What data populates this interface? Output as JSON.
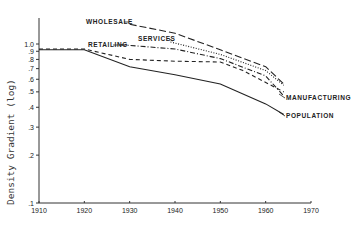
{
  "chart_data": {
    "type": "line",
    "title": "",
    "xlabel": "",
    "ylabel": "Density Gradient (log)",
    "yscale": "log",
    "xlim": [
      1910,
      1970
    ],
    "ylim": [
      0.1,
      1.0
    ],
    "grid": false,
    "legend_position": "inline labels",
    "x_ticks": [
      "1910",
      "1920",
      "1930",
      "1940",
      "1950",
      "1960",
      "1970"
    ],
    "y_ticks": [
      "1.0",
      ".9",
      ".8",
      ".7",
      ".6",
      ".5",
      ".4",
      ".3",
      ".2",
      ".1"
    ],
    "series": [
      {
        "name": "WHOLESALE",
        "style": "long-dash",
        "x": [
          1930,
          1940,
          1950,
          1960,
          1964
        ],
        "values": [
          1.33,
          1.17,
          0.92,
          0.72,
          0.56
        ]
      },
      {
        "name": "SERVICES",
        "style": "dotted",
        "x": [
          1939,
          1950,
          1960,
          1964
        ],
        "values": [
          1.03,
          0.86,
          0.68,
          0.55
        ]
      },
      {
        "name": "RETAILING",
        "style": "dash-dot",
        "x": [
          1928,
          1940,
          1950,
          1960,
          1964
        ],
        "values": [
          0.99,
          0.93,
          0.81,
          0.63,
          0.47
        ]
      },
      {
        "name": "MANUFACTURING",
        "style": "short-dash",
        "x": [
          1910,
          1920,
          1930,
          1940,
          1950,
          1955,
          1964
        ],
        "values": [
          0.93,
          0.93,
          0.8,
          0.78,
          0.77,
          0.68,
          0.5
        ]
      },
      {
        "name": "POPULATION",
        "style": "solid",
        "x": [
          1910,
          1920,
          1930,
          1940,
          1950,
          1960,
          1964
        ],
        "values": [
          0.92,
          0.92,
          0.72,
          0.64,
          0.56,
          0.42,
          0.36
        ]
      }
    ]
  }
}
